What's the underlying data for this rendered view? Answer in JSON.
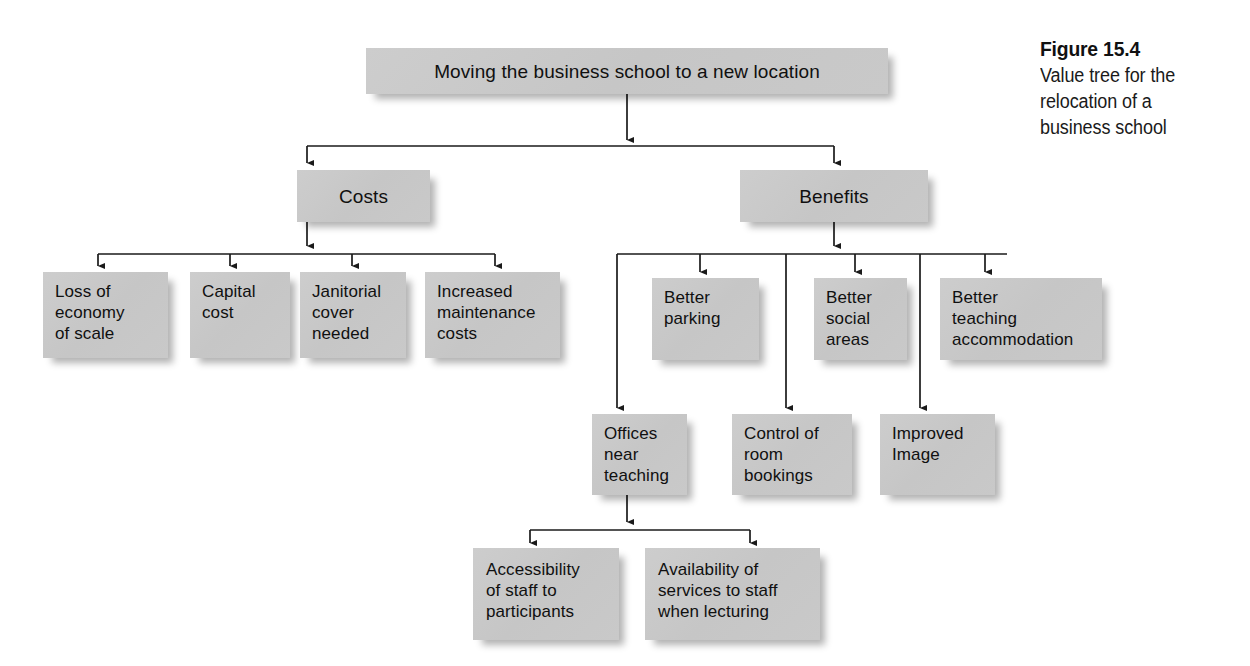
{
  "figure": {
    "number_label": "Figure 15.4",
    "caption": "Value tree for the\nrelocation of a\nbusiness school"
  },
  "colors": {
    "node_fill": "#c9c9c9",
    "node_text": "#101010",
    "connector": "#1a1a1a",
    "page_background": "#ffffff"
  },
  "tree": {
    "root": {
      "label": "Moving the business school to a new location"
    },
    "level2": [
      {
        "label": "Costs"
      },
      {
        "label": "Benefits"
      }
    ],
    "costs_children": [
      {
        "label": "Loss of\neconomy\nof scale"
      },
      {
        "label": "Capital\ncost"
      },
      {
        "label": "Janitorial\ncover\nneeded"
      },
      {
        "label": "Increased\nmaintenance\ncosts"
      }
    ],
    "benefits_children_upper": [
      {
        "label": "Better\nparking"
      },
      {
        "label": "Better\nsocial\nareas"
      },
      {
        "label": "Better\nteaching\naccommodation"
      }
    ],
    "benefits_children_lower": [
      {
        "label": "Offices\nnear\nteaching"
      },
      {
        "label": "Control of\nroom\nbookings"
      },
      {
        "label": "Improved\nImage"
      }
    ],
    "offices_children": [
      {
        "label": "Accessibility\nof staff to\nparticipants"
      },
      {
        "label": "Availability of\nservices to staff\nwhen  lecturing"
      }
    ]
  }
}
